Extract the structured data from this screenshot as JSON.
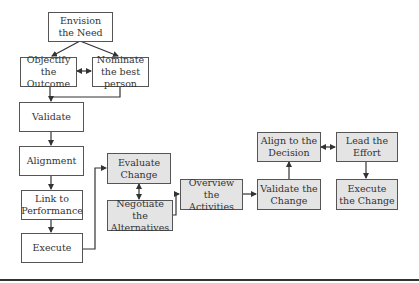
{
  "diagram": {
    "nodes": {
      "envision": {
        "label": "Envision the Need",
        "shaded": false
      },
      "objectify": {
        "label": "Objectify the Outcome",
        "shaded": false
      },
      "nominate": {
        "label": "Nominate the best person",
        "shaded": false
      },
      "validate": {
        "label": "Validate",
        "shaded": false
      },
      "alignment": {
        "label": "Alignment",
        "shaded": false
      },
      "link": {
        "label": "Link to Performance",
        "shaded": false
      },
      "execute": {
        "label": "Execute",
        "shaded": false
      },
      "evaluate": {
        "label": "Evaluate Change",
        "shaded": true
      },
      "negotiate": {
        "label": "Negotiate the Alternatives",
        "shaded": true
      },
      "overview": {
        "label": "Overview the Activities",
        "shaded": true
      },
      "validate_change": {
        "label": "Validate the Change",
        "shaded": true
      },
      "align_decision": {
        "label": "Align to the Decision",
        "shaded": true
      },
      "lead": {
        "label": "Lead the Effort",
        "shaded": true
      },
      "execute_change": {
        "label": "Execute the Change",
        "shaded": true
      }
    },
    "edges": [
      {
        "from": "envision",
        "to": "objectify",
        "type": "arrow"
      },
      {
        "from": "envision",
        "to": "nominate",
        "type": "arrow"
      },
      {
        "from": "objectify",
        "to": "nominate",
        "type": "bidirectional"
      },
      {
        "from": "objectify",
        "to": "validate",
        "type": "arrow"
      },
      {
        "from": "nominate",
        "to": "validate",
        "type": "arrow"
      },
      {
        "from": "validate",
        "to": "alignment",
        "type": "arrow"
      },
      {
        "from": "alignment",
        "to": "link",
        "type": "arrow"
      },
      {
        "from": "link",
        "to": "execute",
        "type": "arrow"
      },
      {
        "from": "execute",
        "to": "evaluate",
        "type": "arrow"
      },
      {
        "from": "evaluate",
        "to": "negotiate",
        "type": "bidirectional"
      },
      {
        "from": "negotiate",
        "to": "overview",
        "type": "arrow"
      },
      {
        "from": "overview",
        "to": "validate_change",
        "type": "arrow"
      },
      {
        "from": "validate_change",
        "to": "align_decision",
        "type": "arrow"
      },
      {
        "from": "align_decision",
        "to": "lead",
        "type": "bidirectional"
      },
      {
        "from": "lead",
        "to": "execute_change",
        "type": "arrow"
      }
    ],
    "colors": {
      "line": "#333333",
      "border": "#555555",
      "shaded_fill": "#e4e4e4",
      "text": "#333333"
    }
  }
}
